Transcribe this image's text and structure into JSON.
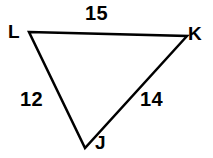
{
  "figure": {
    "type": "triangle-diagram",
    "background_color": "#ffffff",
    "stroke_color": "#000000",
    "stroke_width": 2.5
  },
  "vertices": [
    {
      "name": "L",
      "label": "L",
      "x": 29,
      "y": 32
    },
    {
      "name": "K",
      "label": "K",
      "x": 187,
      "y": 36
    },
    {
      "name": "J",
      "label": "J",
      "x": 85,
      "y": 148
    }
  ],
  "sides": [
    {
      "name": "LK",
      "label": "15",
      "from": "L",
      "to": "K"
    },
    {
      "name": "LJ",
      "label": "12",
      "from": "L",
      "to": "J"
    },
    {
      "name": "JK",
      "label": "14",
      "from": "J",
      "to": "K"
    }
  ],
  "labels": {
    "vertex_L": "L",
    "vertex_K": "K",
    "vertex_J": "J",
    "side_LK": "15",
    "side_LJ": "12",
    "side_JK": "14"
  },
  "geometry": {
    "polygon_points": "29,32 187,36 85,148"
  }
}
